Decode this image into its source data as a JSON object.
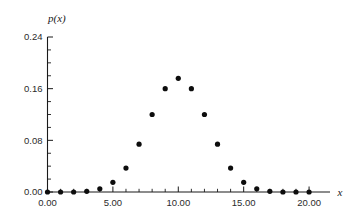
{
  "chart_data": {
    "type": "scatter",
    "title": "",
    "subtitle": "",
    "xlabel": "x",
    "ylabel": "p(x)",
    "x": [
      0,
      1,
      2,
      3,
      4,
      5,
      6,
      7,
      8,
      9,
      10,
      11,
      12,
      13,
      14,
      15,
      16,
      17,
      18,
      19,
      20
    ],
    "values": [
      0.0,
      0.0,
      0.0,
      0.001,
      0.005,
      0.015,
      0.037,
      0.074,
      0.12,
      0.16,
      0.176,
      0.16,
      0.12,
      0.074,
      0.037,
      0.015,
      0.005,
      0.001,
      0.0,
      0.0,
      0.0
    ],
    "categories": [
      "0",
      "1",
      "2",
      "3",
      "4",
      "5",
      "6",
      "7",
      "8",
      "9",
      "10",
      "11",
      "12",
      "13",
      "14",
      "15",
      "16",
      "17",
      "18",
      "19",
      "20"
    ],
    "xlim": [
      0,
      21.6
    ],
    "ylim": [
      0.0,
      0.24
    ],
    "xticks": [
      0,
      5,
      10,
      15,
      20
    ],
    "xticklabels": [
      "0.00",
      "5.00",
      "10.00",
      "15.00",
      "20.00"
    ],
    "xminorticks": [
      1,
      2,
      3,
      4,
      6,
      7,
      8,
      9,
      11,
      12,
      13,
      14,
      16,
      17,
      18,
      19
    ],
    "yticks": [
      0.0,
      0.08,
      0.16,
      0.24
    ],
    "yticklabels": [
      "0.00",
      "0.08",
      "0.16",
      "0.24"
    ],
    "yminorticks": [
      0.02,
      0.04,
      0.06,
      0.1,
      0.12,
      0.14,
      0.18,
      0.2,
      0.22
    ],
    "grid": false,
    "legend": null,
    "legend_position": "none",
    "marker": "filled-circle",
    "marker_color": "#0d0d0d",
    "axis_color": "#1a1a1a",
    "background_color": "#ffffff",
    "annotations": []
  },
  "axes": {
    "y_label_text": "p(x)",
    "x_label_text": "x",
    "y_tick_0": "0.00",
    "y_tick_1": "0.08",
    "y_tick_2": "0.16",
    "y_tick_3": "0.24",
    "x_tick_0": "0.00",
    "x_tick_1": "5.00",
    "x_tick_2": "10.00",
    "x_tick_3": "15.00",
    "x_tick_4": "20.00"
  }
}
